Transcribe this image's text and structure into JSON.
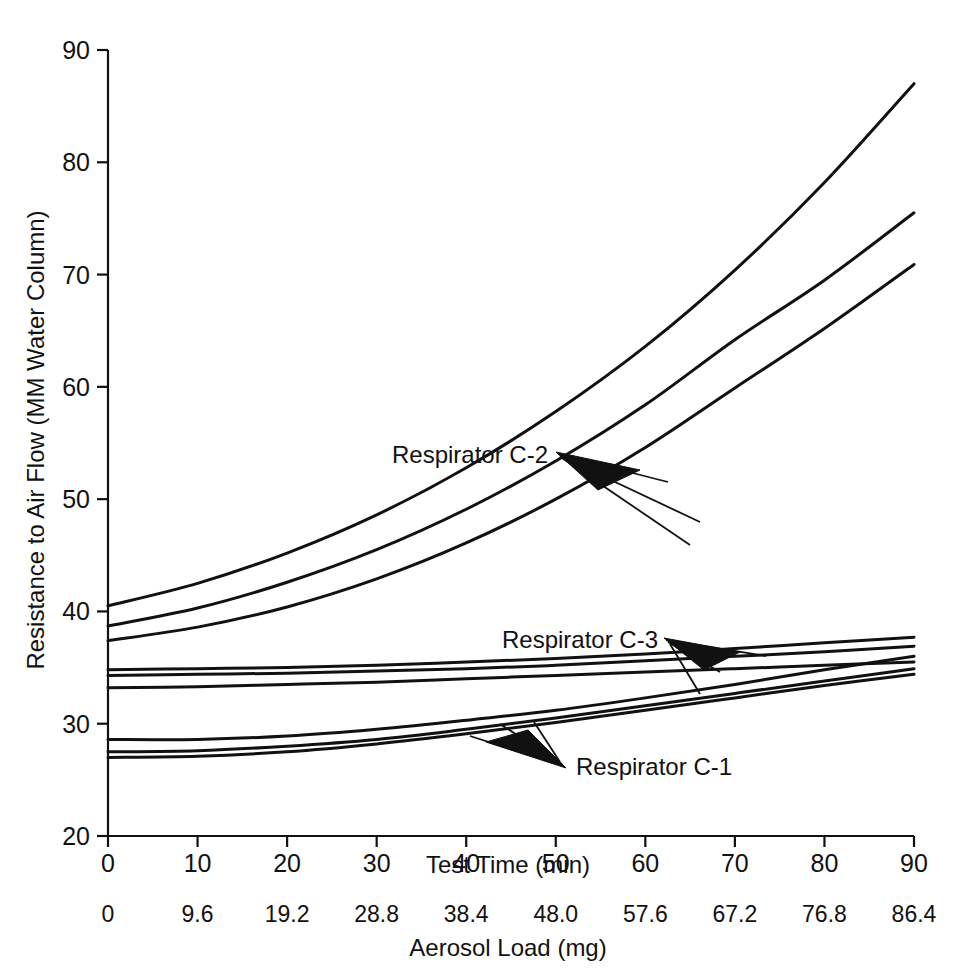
{
  "chart_data": {
    "type": "line",
    "title": "",
    "xlabel": "Test Time (min)",
    "ylabel": "Resistance to Air Flow (MM Water Column)",
    "secondary_xlabel": "Aerosol Load (mg)",
    "xlim": [
      0,
      90
    ],
    "ylim": [
      20,
      90
    ],
    "grid": false,
    "legend_position": "inline-annotations",
    "x_ticks": [
      "0",
      "10",
      "20",
      "30",
      "40",
      "50",
      "60",
      "70",
      "80",
      "90"
    ],
    "x_tick_values": [
      0,
      10,
      20,
      30,
      40,
      50,
      60,
      70,
      80,
      90
    ],
    "y_ticks": [
      "20",
      "30",
      "40",
      "50",
      "60",
      "70",
      "80",
      "90"
    ],
    "y_tick_values": [
      20,
      30,
      40,
      50,
      60,
      70,
      80,
      90
    ],
    "secondary_x_ticks": [
      "0",
      "9.6",
      "19.2",
      "28.8",
      "38.4",
      "48.0",
      "57.6",
      "67.2",
      "76.8",
      "86.4"
    ],
    "secondary_x_tick_values": [
      0,
      9.6,
      19.2,
      28.8,
      38.4,
      48.0,
      57.6,
      67.2,
      76.8,
      86.4
    ],
    "x": [
      0,
      10,
      20,
      30,
      40,
      50,
      60,
      70,
      80,
      90
    ],
    "series": [
      {
        "name": "Respirator C-2 (a)",
        "group": "Respirator C-2",
        "values": [
          40.5,
          42.5,
          45.2,
          48.6,
          52.8,
          57.8,
          63.6,
          70.4,
          78.2,
          87.0
        ]
      },
      {
        "name": "Respirator C-2 (b)",
        "group": "Respirator C-2",
        "values": [
          38.7,
          40.3,
          42.6,
          45.5,
          49.1,
          53.4,
          58.4,
          64.2,
          69.5,
          75.5
        ]
      },
      {
        "name": "Respirator C-2 (c)",
        "group": "Respirator C-2",
        "values": [
          37.4,
          38.6,
          40.4,
          42.9,
          46.1,
          50.0,
          54.6,
          59.9,
          65.2,
          70.9
        ]
      },
      {
        "name": "Respirator C-3 (a)",
        "group": "Respirator C-3",
        "values": [
          34.8,
          34.9,
          35.0,
          35.2,
          35.5,
          35.8,
          36.2,
          36.7,
          37.2,
          37.7
        ]
      },
      {
        "name": "Respirator C-3 (b)",
        "group": "Respirator C-3",
        "values": [
          34.3,
          34.4,
          34.5,
          34.7,
          34.9,
          35.2,
          35.6,
          36.0,
          36.4,
          36.9
        ]
      },
      {
        "name": "Respirator C-3 (c)",
        "group": "Respirator C-3",
        "values": [
          33.2,
          33.3,
          33.5,
          33.7,
          34.0,
          34.3,
          34.6,
          34.9,
          35.2,
          35.5
        ]
      },
      {
        "name": "Respirator C-1 (a)",
        "group": "Respirator C-1",
        "values": [
          28.6,
          28.6,
          28.9,
          29.5,
          30.3,
          31.2,
          32.3,
          33.5,
          34.8,
          36.0
        ]
      },
      {
        "name": "Respirator C-1 (b)",
        "group": "Respirator C-1",
        "values": [
          27.5,
          27.6,
          28.0,
          28.6,
          29.5,
          30.5,
          31.6,
          32.7,
          33.8,
          34.9
        ]
      },
      {
        "name": "Respirator C-1 (c)",
        "group": "Respirator C-1",
        "values": [
          27.0,
          27.1,
          27.5,
          28.2,
          29.1,
          30.1,
          31.2,
          32.3,
          33.4,
          34.4
        ]
      }
    ],
    "annotations": [
      {
        "label": "Respirator C-2",
        "points_to": [
          "Respirator C-2 (a)",
          "Respirator C-2 (b)",
          "Respirator C-2 (c)"
        ]
      },
      {
        "label": "Respirator C-3",
        "points_to": [
          "Respirator C-3 (a)",
          "Respirator C-3 (b)",
          "Respirator C-3 (c)"
        ]
      },
      {
        "label": "Respirator C-1",
        "points_to": [
          "Respirator C-1 (a)",
          "Respirator C-1 (b)",
          "Respirator C-1 (c)"
        ]
      }
    ],
    "colors": {
      "line": "#111111",
      "axis": "#111111",
      "background": "#ffffff"
    }
  },
  "labels": {
    "annotation_c2": "Respirator C-2",
    "annotation_c3": "Respirator C-3",
    "annotation_c1": "Respirator C-1",
    "x_axis_title": "Test Time (min)",
    "secondary_x_axis_title": "Aerosol Load (mg)",
    "y_axis_title": "Resistance to Air Flow (MM Water Column)"
  }
}
